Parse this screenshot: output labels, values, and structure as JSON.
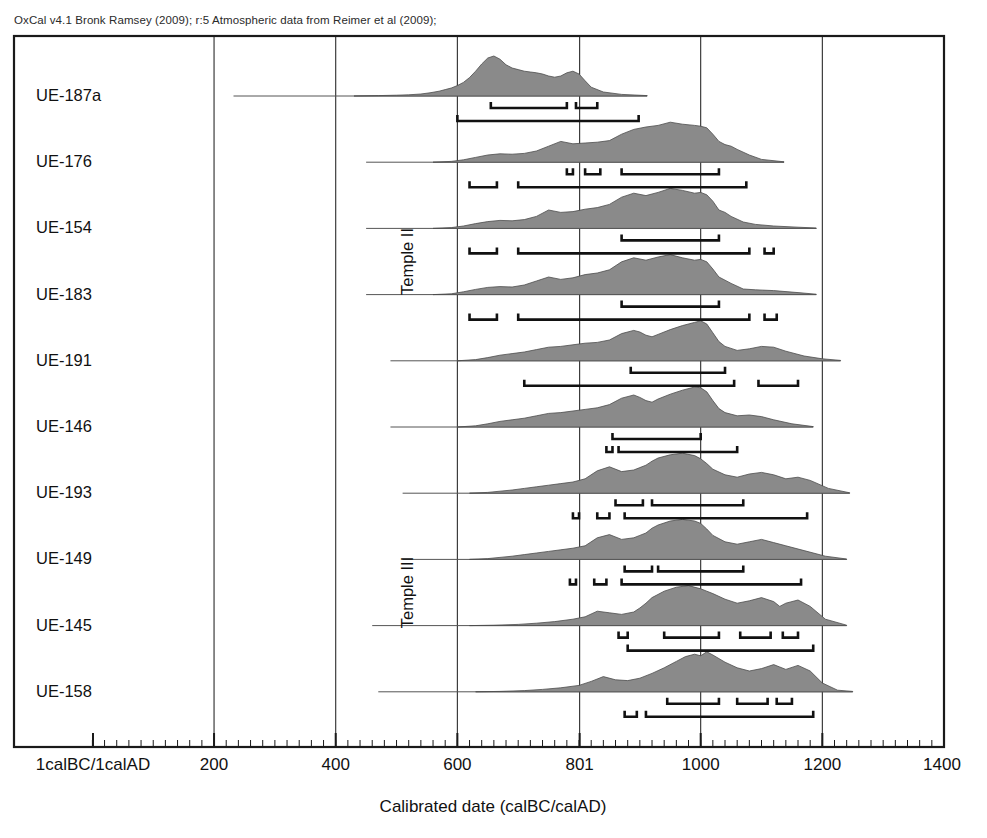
{
  "header": {
    "credit": "OxCal v4.1 Bronk Ramsey (2009); r:5 Atmospheric data from Reimer et al (2009);"
  },
  "axis": {
    "xlabel": "Calibrated date (calBC/calAD)",
    "tick_labels": [
      "1calBC/1calAD",
      "200",
      "400",
      "600",
      "801",
      "1000",
      "1200",
      "1400"
    ],
    "tick_values": [
      1,
      200,
      400,
      600,
      801,
      1000,
      1200,
      1400
    ],
    "gridline_values": [
      200,
      400,
      600,
      801,
      1000,
      1200
    ],
    "minor_tick_step": 20,
    "xmin": 1,
    "xmax": 1400
  },
  "phases": [
    {
      "label": "Temple II",
      "first_row": 0,
      "last_row": 5
    },
    {
      "label": "Temple III",
      "first_row": 6,
      "last_row": 9
    }
  ],
  "style": {
    "fill_color": "#8a8a8a",
    "outline_color": "#4d4d4d",
    "frame_color": "#1a1a1a",
    "grid_color": "#2b2b2b",
    "bracket_color": "#111111",
    "background": "#ffffff"
  },
  "chart_data": {
    "type": "area",
    "xlabel": "Calibrated date (calBC/calAD)",
    "ylabel": "",
    "xlim": [
      1,
      1400
    ],
    "grid": true,
    "legend": "none",
    "series": [
      {
        "name": "UE-187a",
        "baseline_start": 232,
        "baseline_end": 912,
        "x": [
          430,
          470,
          500,
          520,
          540,
          555,
          570,
          580,
          590,
          600,
          610,
          620,
          630,
          640,
          650,
          660,
          670,
          680,
          690,
          700,
          710,
          720,
          730,
          740,
          750,
          760,
          770,
          780,
          790,
          800,
          810,
          820,
          840,
          870,
          912
        ],
        "y": [
          0.0,
          0.01,
          0.02,
          0.03,
          0.05,
          0.08,
          0.12,
          0.16,
          0.2,
          0.26,
          0.34,
          0.46,
          0.62,
          0.8,
          0.95,
          1.0,
          0.92,
          0.78,
          0.7,
          0.66,
          0.62,
          0.6,
          0.58,
          0.55,
          0.5,
          0.47,
          0.5,
          0.58,
          0.62,
          0.55,
          0.38,
          0.22,
          0.1,
          0.04,
          0.01
        ],
        "hpd68": [
          [
            655,
            780
          ],
          [
            795,
            830
          ]
        ],
        "hpd95": [
          [
            600,
            898
          ]
        ]
      },
      {
        "name": "UE-176",
        "baseline_start": 450,
        "baseline_end": 1137,
        "x": [
          560,
          590,
          610,
          630,
          650,
          670,
          690,
          710,
          730,
          750,
          770,
          790,
          810,
          830,
          850,
          870,
          890,
          910,
          930,
          950,
          970,
          990,
          1000,
          1010,
          1020,
          1030,
          1040,
          1050,
          1060,
          1080,
          1100,
          1137
        ],
        "y": [
          0.0,
          0.02,
          0.06,
          0.12,
          0.18,
          0.21,
          0.2,
          0.22,
          0.28,
          0.4,
          0.52,
          0.46,
          0.48,
          0.5,
          0.54,
          0.7,
          0.82,
          0.88,
          0.92,
          1.0,
          0.95,
          0.92,
          0.9,
          0.86,
          0.7,
          0.52,
          0.44,
          0.4,
          0.32,
          0.18,
          0.07,
          0.01
        ],
        "hpd68": [
          [
            780,
            790
          ],
          [
            810,
            835
          ],
          [
            870,
            1030
          ]
        ],
        "hpd95": [
          [
            620,
            665
          ],
          [
            700,
            1075
          ]
        ]
      },
      {
        "name": "UE-154",
        "baseline_start": 450,
        "baseline_end": 1190,
        "x": [
          560,
          590,
          610,
          630,
          650,
          670,
          690,
          710,
          730,
          750,
          770,
          790,
          810,
          830,
          850,
          870,
          890,
          910,
          930,
          950,
          970,
          990,
          1000,
          1010,
          1020,
          1030,
          1040,
          1050,
          1070,
          1090,
          1120,
          1160,
          1190
        ],
        "y": [
          0.0,
          0.02,
          0.06,
          0.12,
          0.17,
          0.2,
          0.19,
          0.22,
          0.3,
          0.46,
          0.4,
          0.42,
          0.48,
          0.52,
          0.6,
          0.78,
          0.88,
          0.82,
          0.9,
          1.0,
          0.95,
          0.88,
          0.9,
          0.84,
          0.68,
          0.46,
          0.4,
          0.3,
          0.16,
          0.1,
          0.06,
          0.03,
          0.01
        ],
        "hpd68": [
          [
            870,
            1030
          ]
        ],
        "hpd95": [
          [
            620,
            665
          ],
          [
            700,
            1080
          ],
          [
            1105,
            1120
          ]
        ]
      },
      {
        "name": "UE-183",
        "baseline_start": 450,
        "baseline_end": 1190,
        "x": [
          560,
          590,
          610,
          630,
          650,
          670,
          690,
          710,
          730,
          750,
          770,
          790,
          810,
          830,
          850,
          870,
          890,
          910,
          930,
          950,
          970,
          990,
          1000,
          1010,
          1020,
          1030,
          1040,
          1050,
          1070,
          1090,
          1120,
          1160,
          1190
        ],
        "y": [
          0.0,
          0.02,
          0.07,
          0.13,
          0.18,
          0.2,
          0.19,
          0.24,
          0.34,
          0.44,
          0.38,
          0.42,
          0.5,
          0.54,
          0.62,
          0.82,
          0.92,
          0.86,
          0.94,
          1.0,
          0.92,
          0.86,
          0.88,
          0.82,
          0.64,
          0.44,
          0.36,
          0.28,
          0.14,
          0.12,
          0.1,
          0.05,
          0.01
        ],
        "hpd68": [
          [
            870,
            1030
          ]
        ],
        "hpd95": [
          [
            620,
            665
          ],
          [
            700,
            1080
          ],
          [
            1105,
            1125
          ]
        ]
      },
      {
        "name": "UE-191",
        "baseline_start": 490,
        "baseline_end": 1230,
        "x": [
          600,
          630,
          650,
          670,
          690,
          710,
          730,
          750,
          770,
          790,
          810,
          830,
          850,
          870,
          890,
          900,
          910,
          920,
          930,
          950,
          970,
          990,
          1000,
          1010,
          1020,
          1030,
          1040,
          1060,
          1080,
          1100,
          1120,
          1140,
          1170,
          1200,
          1230
        ],
        "y": [
          0.0,
          0.03,
          0.08,
          0.14,
          0.18,
          0.22,
          0.28,
          0.34,
          0.36,
          0.4,
          0.44,
          0.46,
          0.52,
          0.68,
          0.76,
          0.72,
          0.64,
          0.6,
          0.66,
          0.78,
          0.88,
          0.96,
          1.0,
          0.92,
          0.7,
          0.48,
          0.36,
          0.26,
          0.3,
          0.36,
          0.34,
          0.24,
          0.12,
          0.05,
          0.01
        ],
        "hpd68": [
          [
            885,
            1040
          ]
        ],
        "hpd95": [
          [
            710,
            1055
          ],
          [
            1095,
            1160
          ]
        ]
      },
      {
        "name": "UE-146",
        "baseline_start": 490,
        "baseline_end": 1185,
        "x": [
          600,
          630,
          650,
          670,
          690,
          710,
          730,
          750,
          770,
          790,
          810,
          830,
          850,
          870,
          890,
          900,
          910,
          920,
          930,
          950,
          970,
          990,
          1000,
          1010,
          1020,
          1030,
          1040,
          1060,
          1080,
          1100,
          1120,
          1150,
          1185
        ],
        "y": [
          0.0,
          0.03,
          0.08,
          0.14,
          0.18,
          0.22,
          0.28,
          0.34,
          0.36,
          0.4,
          0.44,
          0.48,
          0.56,
          0.72,
          0.8,
          0.74,
          0.66,
          0.62,
          0.7,
          0.82,
          0.92,
          1.0,
          0.98,
          0.88,
          0.66,
          0.46,
          0.36,
          0.28,
          0.3,
          0.26,
          0.18,
          0.08,
          0.01
        ],
        "hpd68": [
          [
            855,
            1000
          ]
        ],
        "hpd95": [
          [
            845,
            855
          ],
          [
            865,
            1060
          ]
        ]
      },
      {
        "name": "UE-193",
        "baseline_start": 510,
        "baseline_end": 1245,
        "x": [
          620,
          650,
          670,
          690,
          710,
          730,
          750,
          770,
          790,
          810,
          830,
          850,
          870,
          890,
          900,
          910,
          920,
          930,
          950,
          970,
          990,
          1000,
          1010,
          1020,
          1040,
          1060,
          1080,
          1100,
          1120,
          1140,
          1160,
          1180,
          1210,
          1245
        ],
        "y": [
          0.0,
          0.02,
          0.05,
          0.08,
          0.12,
          0.16,
          0.2,
          0.24,
          0.28,
          0.36,
          0.56,
          0.66,
          0.54,
          0.58,
          0.64,
          0.7,
          0.8,
          0.88,
          0.96,
          1.0,
          0.94,
          0.86,
          0.74,
          0.6,
          0.46,
          0.4,
          0.48,
          0.52,
          0.46,
          0.36,
          0.4,
          0.32,
          0.12,
          0.01
        ],
        "hpd68": [
          [
            860,
            905
          ],
          [
            920,
            1070
          ]
        ],
        "hpd95": [
          [
            790,
            800
          ],
          [
            830,
            850
          ],
          [
            875,
            1175
          ]
        ]
      },
      {
        "name": "UE-149",
        "baseline_start": 510,
        "baseline_end": 1240,
        "x": [
          620,
          650,
          670,
          690,
          710,
          730,
          750,
          770,
          790,
          810,
          830,
          850,
          870,
          890,
          900,
          910,
          920,
          930,
          950,
          970,
          990,
          1000,
          1010,
          1020,
          1040,
          1060,
          1080,
          1100,
          1120,
          1140,
          1170,
          1205,
          1240
        ],
        "y": [
          0.0,
          0.02,
          0.05,
          0.08,
          0.12,
          0.16,
          0.2,
          0.24,
          0.28,
          0.34,
          0.54,
          0.62,
          0.5,
          0.54,
          0.6,
          0.66,
          0.78,
          0.86,
          0.96,
          1.0,
          0.96,
          0.9,
          0.76,
          0.6,
          0.44,
          0.38,
          0.44,
          0.5,
          0.42,
          0.34,
          0.22,
          0.08,
          0.01
        ],
        "hpd68": [
          [
            875,
            920
          ],
          [
            930,
            1070
          ]
        ],
        "hpd95": [
          [
            785,
            795
          ],
          [
            825,
            845
          ],
          [
            870,
            1165
          ]
        ]
      },
      {
        "name": "UE-145",
        "baseline_start": 460,
        "baseline_end": 1240,
        "x": [
          620,
          660,
          700,
          730,
          760,
          790,
          810,
          830,
          850,
          870,
          890,
          900,
          910,
          920,
          940,
          960,
          980,
          1000,
          1010,
          1020,
          1040,
          1060,
          1080,
          1100,
          1120,
          1130,
          1140,
          1160,
          1180,
          1205,
          1240
        ],
        "y": [
          0.0,
          0.01,
          0.03,
          0.06,
          0.1,
          0.16,
          0.22,
          0.36,
          0.32,
          0.28,
          0.34,
          0.44,
          0.56,
          0.7,
          0.86,
          0.96,
          1.0,
          0.92,
          0.86,
          0.8,
          0.66,
          0.56,
          0.62,
          0.7,
          0.6,
          0.48,
          0.56,
          0.64,
          0.48,
          0.16,
          0.01
        ],
        "hpd68": [
          [
            865,
            880
          ],
          [
            940,
            1030
          ],
          [
            1065,
            1115
          ],
          [
            1135,
            1160
          ]
        ],
        "hpd95": [
          [
            880,
            1185
          ]
        ]
      },
      {
        "name": "UE-158",
        "baseline_start": 470,
        "baseline_end": 1250,
        "x": [
          630,
          670,
          710,
          740,
          770,
          800,
          820,
          840,
          860,
          880,
          900,
          920,
          940,
          960,
          975,
          990,
          1000,
          1010,
          1020,
          1040,
          1060,
          1080,
          1100,
          1120,
          1130,
          1140,
          1160,
          1180,
          1200,
          1225,
          1250
        ],
        "y": [
          0.0,
          0.01,
          0.03,
          0.06,
          0.1,
          0.16,
          0.26,
          0.38,
          0.3,
          0.28,
          0.34,
          0.46,
          0.6,
          0.76,
          0.88,
          0.94,
          0.9,
          1.0,
          0.92,
          0.74,
          0.6,
          0.52,
          0.58,
          0.68,
          0.62,
          0.56,
          0.66,
          0.52,
          0.22,
          0.04,
          0.01
        ],
        "hpd68": [
          [
            945,
            1030
          ],
          [
            1060,
            1110
          ],
          [
            1125,
            1150
          ]
        ],
        "hpd95": [
          [
            875,
            895
          ],
          [
            910,
            1185
          ]
        ]
      }
    ]
  }
}
